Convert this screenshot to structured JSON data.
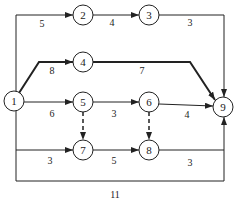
{
  "diagram": {
    "type": "activity-network",
    "nodes": [
      {
        "id": "1",
        "label": "1",
        "x": 14,
        "y": 101
      },
      {
        "id": "2",
        "label": "2",
        "x": 83,
        "y": 15
      },
      {
        "id": "3",
        "label": "3",
        "x": 149,
        "y": 15
      },
      {
        "id": "4",
        "label": "4",
        "x": 83,
        "y": 62
      },
      {
        "id": "5",
        "label": "5",
        "x": 83,
        "y": 102
      },
      {
        "id": "6",
        "label": "6",
        "x": 149,
        "y": 102
      },
      {
        "id": "7",
        "label": "7",
        "x": 83,
        "y": 150
      },
      {
        "id": "8",
        "label": "8",
        "x": 149,
        "y": 150
      },
      {
        "id": "9",
        "label": "9",
        "x": 223,
        "y": 107
      }
    ],
    "edges": [
      {
        "from": "1",
        "to": "2",
        "weight": "5",
        "style": "normal"
      },
      {
        "from": "2",
        "to": "3",
        "weight": "4",
        "style": "normal"
      },
      {
        "from": "3",
        "to": "9",
        "weight": "3",
        "style": "normal"
      },
      {
        "from": "1",
        "to": "4",
        "weight": "8",
        "style": "critical"
      },
      {
        "from": "4",
        "to": "9",
        "weight": "7",
        "style": "critical"
      },
      {
        "from": "1",
        "to": "5",
        "weight": "6",
        "style": "normal"
      },
      {
        "from": "5",
        "to": "6",
        "weight": "3",
        "style": "normal"
      },
      {
        "from": "6",
        "to": "9",
        "weight": "4",
        "style": "normal"
      },
      {
        "from": "5",
        "to": "7",
        "weight": "",
        "style": "dashed"
      },
      {
        "from": "6",
        "to": "8",
        "weight": "",
        "style": "dashed"
      },
      {
        "from": "1",
        "to": "7",
        "weight": "3",
        "style": "normal"
      },
      {
        "from": "7",
        "to": "8",
        "weight": "5",
        "style": "normal"
      },
      {
        "from": "8",
        "to": "9",
        "weight": "3",
        "style": "normal"
      },
      {
        "from": "1",
        "to": "9",
        "weight": "11",
        "style": "normal"
      }
    ]
  }
}
